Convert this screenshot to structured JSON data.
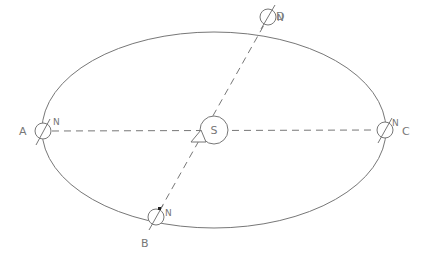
{
  "diagram": {
    "title": "",
    "sun": {
      "label": "S"
    },
    "positions": [
      {
        "id": "A",
        "label": "A",
        "north_label": "N"
      },
      {
        "id": "B",
        "label": "B",
        "north_label": "N"
      },
      {
        "id": "C",
        "label": "C",
        "north_label": "N"
      },
      {
        "id": "D",
        "label": "D",
        "north_label": "N"
      }
    ],
    "colors": {
      "line": "#777777",
      "background": "#ffffff",
      "marker": "#222222"
    }
  }
}
